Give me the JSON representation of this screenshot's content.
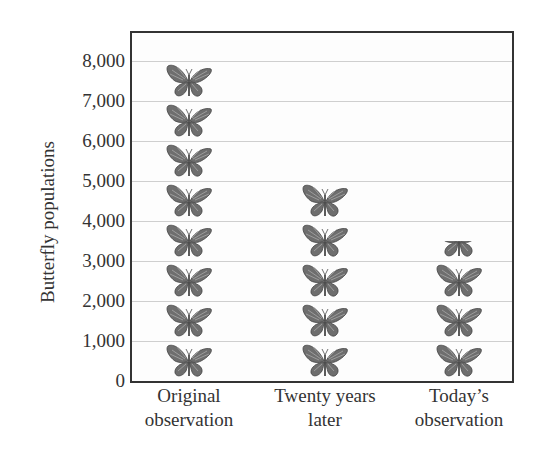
{
  "chart_data": {
    "type": "bar",
    "style": "pictograph",
    "title": "",
    "xlabel": "",
    "ylabel": "Butterfly populations",
    "ylim": [
      0,
      8000
    ],
    "yticks": [
      "0",
      "1,000",
      "2,000",
      "3,000",
      "4,000",
      "5,000",
      "6,000",
      "7,000",
      "8,000"
    ],
    "grid": true,
    "legend": "none",
    "icon": "butterfly-icon",
    "icon_value": 1000,
    "categories": [
      "Original observation",
      "Twenty years later",
      "Today's observation"
    ],
    "category_lines": [
      [
        "Original",
        "observation"
      ],
      [
        "Twenty years",
        "later"
      ],
      [
        "Today’s",
        "observation"
      ]
    ],
    "values": [
      8000,
      5000,
      3500
    ]
  },
  "colors": {
    "frame": "#333333",
    "grid": "#cfcfcf",
    "butterfly": "#6e6e6e",
    "text": "#333333"
  }
}
